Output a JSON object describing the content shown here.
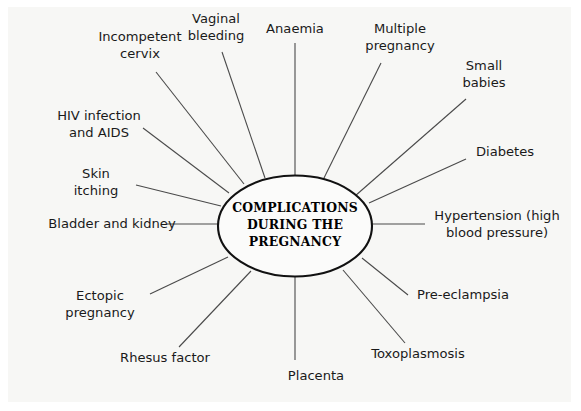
{
  "diagram": {
    "type": "radial-spoke-diagram",
    "title_lines": [
      "COMPLICATIONS",
      "DURING THE",
      "PREGNANCY"
    ],
    "center_label": "COMPLICATIONS DURING THE PREGNANCY",
    "background_color": "#f7f7f5",
    "line_color": "#4a4a4a",
    "hub_border_color": "#111111",
    "text_color": "#1a1a1a",
    "node_count": 16,
    "nodes": [
      {
        "id": "anaemia",
        "lines": [
          "Anaemia"
        ],
        "label": "Anaemia",
        "text_x": 295,
        "text_y": 33,
        "line": {
          "x1": 295,
          "y1": 43,
          "x2": 295,
          "y2": 176
        }
      },
      {
        "id": "multiple-pregnancy",
        "lines": [
          "Multiple",
          "pregnancy"
        ],
        "label": "Multiple pregnancy",
        "text_x": 400,
        "text_y": 33,
        "line": {
          "x1": 381,
          "y1": 63,
          "x2": 322,
          "y2": 182
        }
      },
      {
        "id": "small-babies",
        "lines": [
          "Small",
          "babies"
        ],
        "label": "Small babies",
        "text_x": 484,
        "text_y": 70,
        "line": {
          "x1": 466,
          "y1": 99,
          "x2": 355,
          "y2": 196
        }
      },
      {
        "id": "diabetes",
        "lines": [
          "Diabetes"
        ],
        "label": "Diabetes",
        "text_x": 505,
        "text_y": 156,
        "line": {
          "x1": 466,
          "y1": 159,
          "x2": 369,
          "y2": 203
        }
      },
      {
        "id": "hypertension",
        "lines": [
          "Hypertension (high",
          "blood pressure)"
        ],
        "label": "Hypertension (high blood pressure)",
        "text_x": 497,
        "text_y": 220,
        "line": {
          "x1": 425,
          "y1": 224,
          "x2": 372,
          "y2": 224
        }
      },
      {
        "id": "pre-eclampsia",
        "lines": [
          "Pre-eclampsia"
        ],
        "label": "Pre-eclampsia",
        "text_x": 463,
        "text_y": 299,
        "line": {
          "x1": 408,
          "y1": 295,
          "x2": 362,
          "y2": 258
        }
      },
      {
        "id": "toxoplasmosis",
        "lines": [
          "Toxoplasmosis"
        ],
        "label": "Toxoplasmosis",
        "text_x": 418,
        "text_y": 358,
        "line": {
          "x1": 405,
          "y1": 343,
          "x2": 343,
          "y2": 270
        }
      },
      {
        "id": "placenta",
        "lines": [
          "Placenta"
        ],
        "label": "Placenta",
        "text_x": 316,
        "text_y": 380,
        "line": {
          "x1": 295,
          "y1": 360,
          "x2": 295,
          "y2": 277
        }
      },
      {
        "id": "rhesus-factor",
        "lines": [
          "Rhesus factor"
        ],
        "label": "Rhesus factor",
        "text_x": 165,
        "text_y": 362,
        "line": {
          "x1": 179,
          "y1": 347,
          "x2": 251,
          "y2": 271
        }
      },
      {
        "id": "ectopic-pregnancy",
        "lines": [
          "Ectopic",
          "pregnancy"
        ],
        "label": "Ectopic pregnancy",
        "text_x": 100,
        "text_y": 300,
        "line": {
          "x1": 150,
          "y1": 294,
          "x2": 228,
          "y2": 257
        }
      },
      {
        "id": "bladder-and-kidney",
        "lines": [
          "Bladder and kidney"
        ],
        "label": "Bladder and kidney",
        "text_x": 112,
        "text_y": 228,
        "line": {
          "x1": 167,
          "y1": 224,
          "x2": 218,
          "y2": 224
        }
      },
      {
        "id": "skin-itching",
        "lines": [
          "Skin",
          "itching"
        ],
        "label": "Skin itching",
        "text_x": 96,
        "text_y": 178,
        "line": {
          "x1": 136,
          "y1": 185,
          "x2": 221,
          "y2": 206
        }
      },
      {
        "id": "hiv-infection-and-aids",
        "lines": [
          "HIV infection",
          "and AIDS"
        ],
        "label": "HIV infection and AIDS",
        "text_x": 99,
        "text_y": 120,
        "line": {
          "x1": 143,
          "y1": 128,
          "x2": 229,
          "y2": 193
        }
      },
      {
        "id": "incompetent-cervix",
        "lines": [
          "Incompetent",
          "cervix"
        ],
        "label": "Incompetent cervix",
        "text_x": 140,
        "text_y": 41,
        "line": {
          "x1": 156,
          "y1": 72,
          "x2": 244,
          "y2": 184
        }
      },
      {
        "id": "vaginal-bleeding",
        "lines": [
          "Vaginal",
          "bleeding"
        ],
        "label": "Vaginal bleeding",
        "text_x": 216,
        "text_y": 23,
        "line": {
          "x1": 222,
          "y1": 52,
          "x2": 265,
          "y2": 178
        }
      }
    ]
  }
}
